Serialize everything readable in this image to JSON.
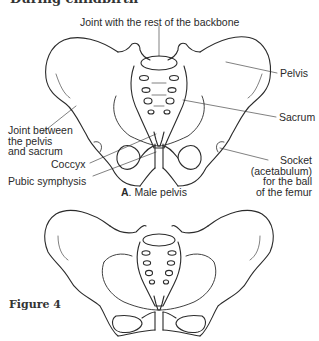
{
  "header": {
    "title": "During childbirth"
  },
  "diagram_a": {
    "caption_letter": "A",
    "caption_text": ". Male pelvis",
    "labels": {
      "backbone_joint": "Joint with the rest of the backbone",
      "pelvis": "Pelvis",
      "sacrum": "Sacrum",
      "joint_pelvis_sacrum": [
        "Joint between",
        "the pelvis",
        "and sacrum"
      ],
      "coccyx": "Coccyx",
      "pubic_symphysis": "Pubic symphysis",
      "socket": [
        "Socket",
        "(acetabulum)",
        "for the ball",
        "of the femur"
      ]
    }
  },
  "diagram_b": {
    "caption": ""
  },
  "figure": {
    "label": "Figure 4"
  }
}
